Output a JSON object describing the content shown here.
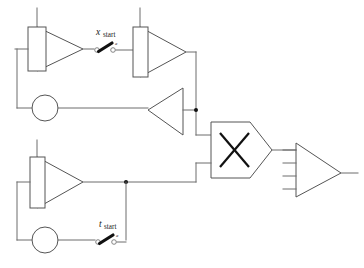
{
  "diagram": {
    "canvas": {
      "width": 364,
      "height": 268,
      "background": "#ffffff"
    },
    "colors": {
      "wire": "#6d6d6d",
      "outline": "#555555",
      "symbol": "#111111",
      "label": "#1a1a1a",
      "background": "#ffffff"
    },
    "labels": {
      "x_start": {
        "variable": "x",
        "subscript": "start",
        "switch_terminal": "a"
      },
      "t_start": {
        "variable": "t",
        "subscript": "start",
        "switch_terminal": "a"
      }
    },
    "blocks": [
      {
        "id": "integrator-top-left",
        "type": "integrator",
        "row": "top",
        "position": "left"
      },
      {
        "id": "integrator-top-right",
        "type": "integrator",
        "row": "top",
        "position": "right"
      },
      {
        "id": "summer-top",
        "type": "summing-junction",
        "row": "top",
        "shape": "circle"
      },
      {
        "id": "inverter-top",
        "type": "inverting-amplifier",
        "row": "top",
        "orientation": "left"
      },
      {
        "id": "integrator-bottom",
        "type": "integrator",
        "row": "bottom",
        "position": "left"
      },
      {
        "id": "summer-bottom",
        "type": "summing-junction",
        "row": "bottom",
        "shape": "circle"
      },
      {
        "id": "multiplier",
        "type": "multiplier",
        "symbol": "X",
        "inputs": 2,
        "outputs": 1
      },
      {
        "id": "output-amplifier",
        "type": "amplifier",
        "inputs": 4,
        "outputs": 1
      }
    ],
    "switches": [
      {
        "id": "switch-x-start",
        "label": "x_start",
        "state": "open",
        "terminals": 2
      },
      {
        "id": "switch-t-start",
        "label": "t_start",
        "state": "open",
        "terminals": 2
      }
    ]
  }
}
